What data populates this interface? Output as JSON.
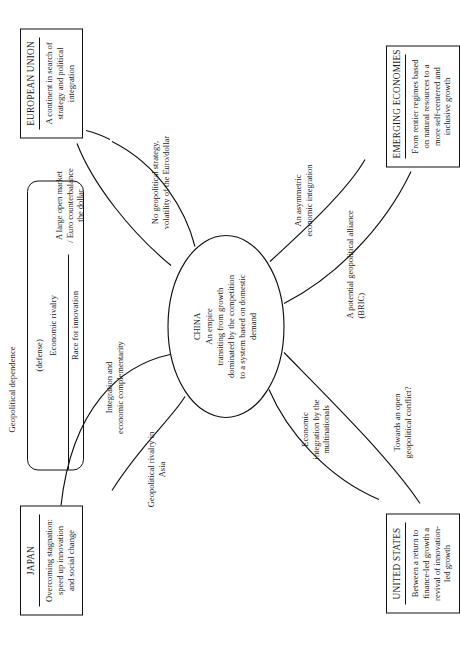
{
  "diagram": {
    "type": "concept-map",
    "orientation": "rotated-90-ccw",
    "center": {
      "name": "CHINA",
      "description": "An empire\ntransiting from growth\ndominated by the competition\nto a system based on domestic\ndemand"
    },
    "nodes": [
      {
        "id": "japan",
        "title": "JAPAN",
        "description": "Overcoming stagnation:\nspeed up  innovation\nand social change"
      },
      {
        "id": "european-union",
        "title": "EUROPEAN UNION",
        "description": "A continent in search of\nstrategy and political\nintegration"
      },
      {
        "id": "united-states",
        "title": "UNITED STATES",
        "description": "Between a return to\nfinance-led growth  a\nrevival of innovation-\nled growth"
      },
      {
        "id": "emerging-economies",
        "title": "EMERGING ECONOMIES",
        "description": "From rentier regimes based\non natural resources to  a\nmore self-centered and\ninclusive growth"
      }
    ],
    "relations_panel": {
      "heading": "Geopolitical dependence",
      "subheading": "(defense)",
      "rows": [
        "Economic rivalry",
        "Race for innovation"
      ]
    },
    "edge_labels": [
      {
        "id": "japan-rivalry",
        "text": "Geopolitical rivalry in\nAsia"
      },
      {
        "id": "japan-integration",
        "text": "Integration and\neconomic complementarity"
      },
      {
        "id": "eu-market",
        "text": "A large open market\n/ Euro counterbalance\nthe dollar"
      },
      {
        "id": "eu-strategy",
        "text": "No  geopolitical strategy,\nvolatility of the Euro/dollar"
      },
      {
        "id": "us-multinationals",
        "text": "Economic\nintegration  by the\nmultinationals"
      },
      {
        "id": "us-conflict",
        "text": "Towards an open\ngeopolitical conflict?"
      },
      {
        "id": "emerging-bric",
        "text": "A potential geopolitical alliance\n(BRIC)"
      },
      {
        "id": "emerging-asymmetric",
        "text": "An asymmetric\neconomic integration"
      }
    ]
  }
}
